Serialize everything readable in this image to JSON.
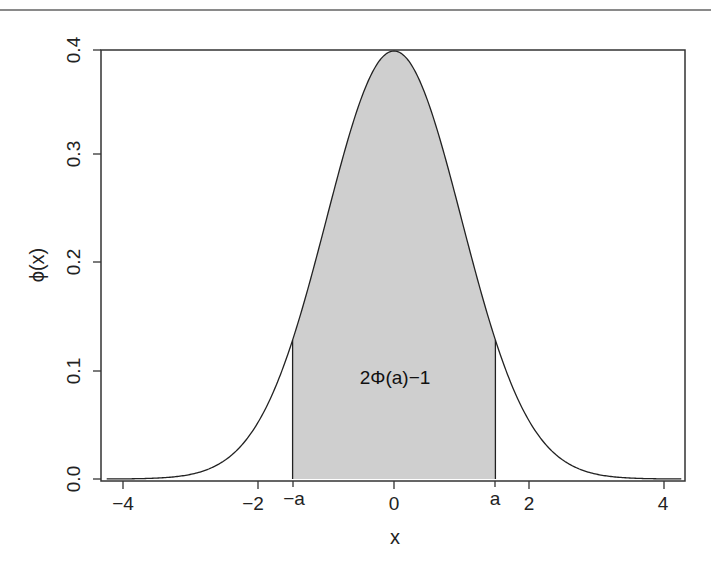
{
  "chart_data": {
    "type": "area",
    "title": "",
    "xlabel": "x",
    "ylabel": "ϕ(x)",
    "xlim": [
      -4.3,
      4.3
    ],
    "ylim": [
      0.0,
      0.4
    ],
    "grid": false,
    "x_ticks": [
      -4,
      -2,
      0,
      2,
      4
    ],
    "x_tick_labels": [
      "−4",
      "−2",
      "0",
      "2",
      "4"
    ],
    "y_ticks": [
      0.0,
      0.1,
      0.2,
      0.3,
      0.4
    ],
    "y_tick_labels": [
      "0.0",
      "0.1",
      "0.2",
      "0.3",
      "0.4"
    ],
    "extra_x_labels": [
      {
        "x": -1.5,
        "label": "−a"
      },
      {
        "x": 1.5,
        "label": "a"
      }
    ],
    "series": [
      {
        "name": "standard normal density ϕ(x)",
        "function": "exp(-x^2/2)/sqrt(2*pi)",
        "x": [
          -4,
          -3.5,
          -3,
          -2.5,
          -2,
          -1.5,
          -1,
          -0.5,
          0,
          0.5,
          1,
          1.5,
          2,
          2.5,
          3,
          3.5,
          4
        ],
        "values": [
          0.0001,
          0.0009,
          0.0044,
          0.0175,
          0.054,
          0.1295,
          0.242,
          0.3521,
          0.3989,
          0.3521,
          0.242,
          0.1295,
          0.054,
          0.0175,
          0.0044,
          0.0009,
          0.0001
        ]
      }
    ],
    "shaded_region": {
      "from": -1.5,
      "to": 1.5,
      "color": "#cfcfcf"
    },
    "annotations": [
      {
        "text": "2Φ(a)−1",
        "x": 0,
        "y": 0.12
      }
    ]
  },
  "labels": {
    "xlabel": "x",
    "ylabel": "ϕ(x)",
    "annotation": "2Φ(a)−1",
    "neg_a": "−a",
    "pos_a": "a",
    "xticks": [
      "−4",
      "−2",
      "0",
      "2",
      "4"
    ],
    "yticks": [
      "0.0",
      "0.1",
      "0.2",
      "0.3",
      "0.4"
    ]
  },
  "colors": {
    "shade": "#cfcfcf",
    "line": "#222222",
    "rule": "#8a8a8a"
  }
}
